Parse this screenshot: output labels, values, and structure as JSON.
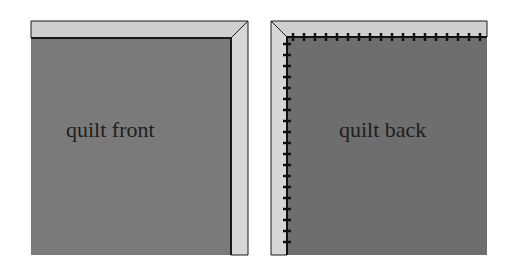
{
  "diagram": {
    "colors": {
      "background": "#ffffff",
      "quilt_fill": "#7a7a7a",
      "binding_fill": "#cfcfcf",
      "outline": "#1a1a1a",
      "stitch": "#111111"
    },
    "panels": [
      {
        "id": "front",
        "label": "quilt front",
        "binding_sides": [
          "top",
          "right"
        ],
        "stitching": false
      },
      {
        "id": "back",
        "label": "quilt back",
        "binding_sides": [
          "top",
          "left"
        ],
        "stitching": true,
        "stitch_edges": [
          "top",
          "left"
        ]
      }
    ]
  }
}
